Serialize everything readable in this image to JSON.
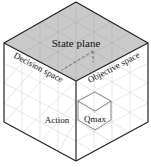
{
  "diagram": {
    "type": "isometric-cube",
    "colors": {
      "top_face": "#c9c9c9",
      "side_faces": "#ffffff",
      "edge": "#222222",
      "grid": "#d4d4d4",
      "top_grid": "#b4b4b4",
      "text": "#111111"
    },
    "labels": {
      "top": "State plane",
      "left": "Decision space",
      "right": "Objective space",
      "action": "Action",
      "qmax": "Qmax"
    }
  }
}
